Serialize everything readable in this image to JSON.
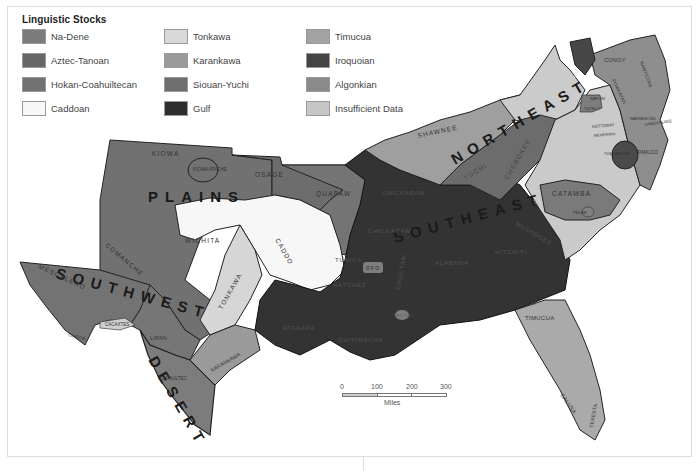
{
  "legend": {
    "title": "Linguistic Stocks",
    "items": [
      {
        "label": "Na-Dene",
        "color": "#7b7b7b"
      },
      {
        "label": "Aztec-Tanoan",
        "color": "#666666"
      },
      {
        "label": "Hokan-Coahuiltecan",
        "color": "#727272"
      },
      {
        "label": "Caddoan",
        "color": "#f7f7f7"
      },
      {
        "label": "Tonkawa",
        "color": "#d9d9d9"
      },
      {
        "label": "Karankawa",
        "color": "#9a9a9a"
      },
      {
        "label": "Siouan-Yuchi",
        "color": "#6e6e6e"
      },
      {
        "label": "Gulf",
        "color": "#2e2e2e"
      },
      {
        "label": "Timucua",
        "color": "#a3a3a3"
      },
      {
        "label": "Iroquoian",
        "color": "#444444"
      },
      {
        "label": "Algonkian",
        "color": "#8a8a8a"
      },
      {
        "label": "Insufficient Data",
        "color": "#c6c6c6"
      }
    ]
  },
  "regions": {
    "plains": "PLAINS",
    "southwest": "SOUTHWEST",
    "desert": "DESERT",
    "southeast": "SOUTHEAST",
    "northeast": "NORTHEAST"
  },
  "tribes": {
    "kiowa": "KIOWA",
    "kiowa_apache": "KIOWA APACHE",
    "osage": "OSAGE",
    "quapaw": "QUAPAW",
    "wichita": "WICHITA",
    "caddo": "CADDO",
    "comanche": "COMANCHE",
    "tonkawa": "TONKAWA",
    "mescalero": "MESCALERO",
    "jumano": "JUMANO",
    "chisos": "CHISOS",
    "cacaxtes": "CACAXTES",
    "lipan": "LIPAN",
    "coahuiltec": "COAHUILTEC",
    "karankawa": "KARANKAWA",
    "atakapa": "ATAKAPA",
    "chitimacha": "CHITIMACHA",
    "tunica": "TUNICA",
    "natchez": "NATCHEZ",
    "ofo": "OFO",
    "biloxi": "BILOXI",
    "chickasaw": "CHICKASAW",
    "choctaw": "CHOCTAW",
    "alabama": "ALABAMA",
    "hitchiti": "HITCHITI",
    "muskogee": "MUSKOGEE",
    "yuchi": "YUCHI",
    "cherokee": "CHEROKEE",
    "shawnee": "SHAWNEE",
    "catawba": "CATAWBA",
    "pedee": "PEDEE",
    "yamasee": "YAMASEE",
    "guale": "GUALE",
    "timucua": "TIMUCUA",
    "calusa": "CALUSA",
    "tekesta": "TEKESTA",
    "saponi": "SAPONI",
    "tutelo": "TUTELO",
    "conoy": "CONOY",
    "nanticoke": "NANTICOKE",
    "powhatan": "POWHATAN",
    "nansemond": "NANSEMOND",
    "chesapeake": "CHESAPEAKE",
    "nottoway": "NOTTOWAY",
    "meherrin": "MEHERRIN",
    "tuscarora": "TUSCARORA",
    "pamlico": "PAMLICO",
    "erie": "ERIE"
  },
  "scale": {
    "ticks": [
      "0",
      "100",
      "200",
      "300"
    ],
    "unit": "Miles"
  }
}
